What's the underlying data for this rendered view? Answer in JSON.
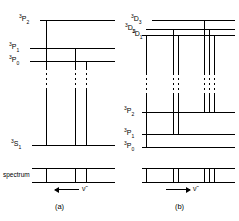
{
  "figure": {
    "type": "energy-level-diagram",
    "line_color": "#000000",
    "background": "#ffffff"
  },
  "panel_a": {
    "caption": "(a)",
    "spectrum_label": "spectrum",
    "axis_symbol": "ν̃",
    "axis_direction": "left",
    "upper_levels": [
      {
        "id": "3P2",
        "sup": "3",
        "core": "P",
        "sub": "2",
        "y": 20
      },
      {
        "id": "3P1",
        "sup": "3",
        "core": "P",
        "sub": "1",
        "y": 48
      },
      {
        "id": "3P0",
        "sup": "3",
        "core": "P",
        "sub": "0",
        "y": 61
      }
    ],
    "lower_levels": [
      {
        "id": "3S1",
        "sup": "3",
        "core": "S",
        "sub": "1",
        "y": 145
      }
    ],
    "transitions": [
      {
        "from": "3P2",
        "to": "3S1",
        "x": 46
      },
      {
        "from": "3P1",
        "to": "3S1",
        "x": 75
      },
      {
        "from": "3P0",
        "to": "3S1",
        "x": 86
      }
    ],
    "spectrum_lines": [
      46,
      75,
      86
    ]
  },
  "panel_b": {
    "caption": "(b)",
    "axis_symbol": "ν̃",
    "axis_direction": "right",
    "upper_levels": [
      {
        "id": "3D3",
        "sup": "3",
        "core": "D",
        "sub": "3",
        "y": 20
      },
      {
        "id": "3D2",
        "sup": "3",
        "core": "D",
        "sub": "2",
        "y": 29
      },
      {
        "id": "3D1",
        "sup": "3",
        "core": "D",
        "sub": "1",
        "y": 35
      }
    ],
    "lower_levels": [
      {
        "id": "3P2",
        "sup": "3",
        "core": "P",
        "sub": "2",
        "y": 112
      },
      {
        "id": "3P1",
        "sup": "3",
        "core": "P",
        "sub": "1",
        "y": 134
      },
      {
        "id": "3P0",
        "sup": "3",
        "core": "P",
        "sub": "0",
        "y": 147
      }
    ],
    "transitions": [
      {
        "from": "3D1",
        "to": "3P0",
        "x": 26
      },
      {
        "from": "3D2",
        "to": "3P1",
        "x": 53
      },
      {
        "from": "3D1",
        "to": "3P1",
        "x": 58
      },
      {
        "from": "3D3",
        "to": "3P2",
        "x": 84
      },
      {
        "from": "3D2",
        "to": "3P2",
        "x": 89
      },
      {
        "from": "3D1",
        "to": "3P2",
        "x": 94
      }
    ],
    "spectrum_lines": [
      26,
      53,
      58,
      84,
      89,
      94
    ]
  }
}
